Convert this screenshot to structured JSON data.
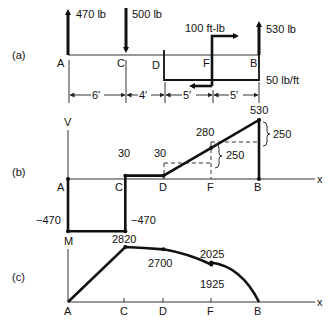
{
  "panels": {
    "a": {
      "label": "(a)",
      "loads": {
        "reaction_A": "470 lb",
        "load_C": "500 lb",
        "moment_F": "100 ft-lb",
        "reaction_B": "530 lb",
        "distributed": "50 lb/ft"
      },
      "points": {
        "A": "A",
        "C": "C",
        "D": "D",
        "F": "F",
        "B": "B"
      },
      "dimensions": [
        "6′",
        "4′",
        "5′",
        "5′"
      ]
    },
    "b": {
      "label": "(b)",
      "axis_y": "V",
      "axis_x": "x",
      "points": {
        "A": "A",
        "C": "C",
        "D": "D",
        "F": "F",
        "B": "B"
      },
      "values": {
        "A_bottom": "−470",
        "C_bottom": "−470",
        "C_top": "30",
        "D": "30",
        "F": "280",
        "B": "530",
        "delta_DF": "250",
        "delta_FB": "250"
      }
    },
    "c": {
      "label": "(c)",
      "axis_y": "M",
      "axis_x": "x",
      "points": {
        "A": "A",
        "C": "C",
        "D": "D",
        "F": "F",
        "B": "B"
      },
      "values": {
        "C": "2820",
        "D": "2700",
        "F_low": "1925",
        "F_high": "2025"
      }
    }
  },
  "chart_data": [
    {
      "type": "line",
      "title": "Shear diagram",
      "xlabel": "x",
      "ylabel": "V",
      "x_positions_ft": {
        "A": 0,
        "C": 6,
        "D": 10,
        "F": 15,
        "B": 20
      },
      "points": [
        [
          0,
          0
        ],
        [
          0,
          -470
        ],
        [
          6,
          -470
        ],
        [
          6,
          30
        ],
        [
          10,
          30
        ],
        [
          15,
          280
        ],
        [
          20,
          530
        ],
        [
          20,
          0
        ]
      ]
    },
    {
      "type": "line",
      "title": "Moment diagram",
      "xlabel": "x",
      "ylabel": "M",
      "x_positions_ft": {
        "A": 0,
        "C": 6,
        "D": 10,
        "F": 15,
        "B": 20
      },
      "points": [
        [
          0,
          0
        ],
        [
          6,
          2820
        ],
        [
          10,
          2700
        ],
        [
          15,
          1925
        ],
        [
          15,
          2025
        ],
        [
          20,
          0
        ]
      ]
    }
  ]
}
